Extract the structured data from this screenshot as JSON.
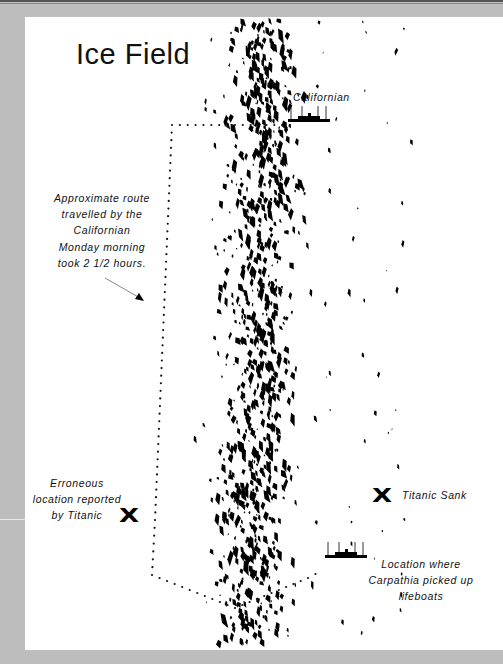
{
  "title": "Ice Field",
  "labels": {
    "californian": "Californian",
    "route_note": [
      "Approximate route",
      "travelled by the",
      "Californian",
      "Monday morning",
      "took 2 1/2 hours."
    ],
    "erroneous": [
      "Erroneous",
      "location reported",
      "by Titanic"
    ],
    "titanic_sank": "Titanic Sank",
    "carpathia": [
      "Location where",
      "Carpathia picked up",
      "lifeboats"
    ]
  },
  "markers": {
    "x_glyph": "X",
    "erroneous_x": {
      "x": 119,
      "y": 505
    },
    "sank_x": {
      "x": 372,
      "y": 485
    }
  },
  "ships": {
    "californian": {
      "name": "californian-ship-icon",
      "x": 288,
      "y": 113
    },
    "carpathia": {
      "name": "carpathia-ship-icon",
      "x": 325,
      "y": 549
    }
  },
  "route": {
    "points": [
      [
        290,
        125
      ],
      [
        172,
        125
      ],
      [
        155,
        520
      ],
      [
        152,
        575
      ],
      [
        235,
        608
      ],
      [
        308,
        578
      ],
      [
        323,
        570
      ]
    ],
    "dot_color": "#111"
  },
  "arrow": {
    "from": [
      105,
      278
    ],
    "to": [
      140,
      298
    ],
    "color": "#888"
  },
  "ice_field": {
    "color": "#000",
    "seed": 42,
    "count": 900,
    "center_x_top": 265,
    "center_x_bottom": 250,
    "spread": 42,
    "y_min": 17,
    "y_max": 640
  },
  "colors": {
    "background": "#bdbdbd",
    "panel": "#ffffff",
    "ink": "#111111"
  }
}
